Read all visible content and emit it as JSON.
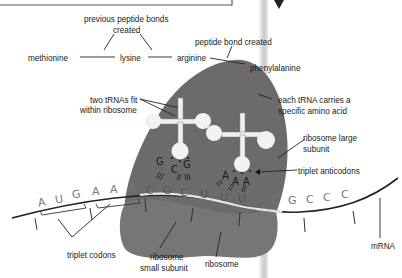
{
  "diagram": {
    "labels": {
      "previous_bonds": "previous peptide bonds created",
      "previous_bonds_l1": "previous peptide bonds",
      "previous_bonds_l2": "created",
      "peptide_bond": "peptide bond created",
      "two_trnas_l1": "two tRNAs fit",
      "two_trnas_l2": "within ribosome",
      "each_trna_l1": "each tRNA carries a",
      "each_trna_l2": "specific amino acid",
      "large_subunit_l1": "ribosome large",
      "large_subunit_l2": "subunit",
      "triplet_anticodons": "triplet anticodons",
      "triplet_codons": "triplet codons",
      "small_subunit_l1": "ribosome",
      "small_subunit_l2": "small subunit",
      "ribosome": "ribosome",
      "mrna": "mRNA"
    },
    "amino_acids": [
      "methionine",
      "lysine",
      "arginine",
      "phenylalanine"
    ],
    "mrna_sequence": [
      "A",
      "U",
      "G",
      "A",
      "A",
      "A",
      "C",
      "G",
      "C",
      "U",
      "U",
      "U",
      "C",
      "G",
      "C",
      "C",
      "C"
    ],
    "trna_left_anticodon": [
      "G",
      "C",
      "G"
    ],
    "trna_right_anticodon": [
      "A",
      "A",
      "A"
    ],
    "colors": {
      "ribosome": "#6b6b6b",
      "ribosome_small": "#777777",
      "trna": "#f2f2f2",
      "line": "#222222",
      "nucleotide": "#777777"
    }
  }
}
